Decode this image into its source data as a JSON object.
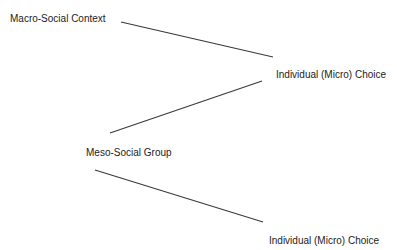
{
  "diagram": {
    "nodes": [
      {
        "id": "macro",
        "label": "Macro-Social Context"
      },
      {
        "id": "micro-1",
        "label": "Individual (Micro) Choice"
      },
      {
        "id": "meso",
        "label": "Meso-Social Group"
      },
      {
        "id": "micro-2",
        "label": "Individual (Micro) Choice"
      }
    ],
    "edges": [
      {
        "from": "macro",
        "to": "micro-1"
      },
      {
        "from": "meso",
        "to": "micro-1"
      },
      {
        "from": "meso",
        "to": "micro-2"
      }
    ],
    "colors": {
      "line": "#3a3a3a",
      "text": "#222222",
      "background": "#ffffff"
    }
  }
}
